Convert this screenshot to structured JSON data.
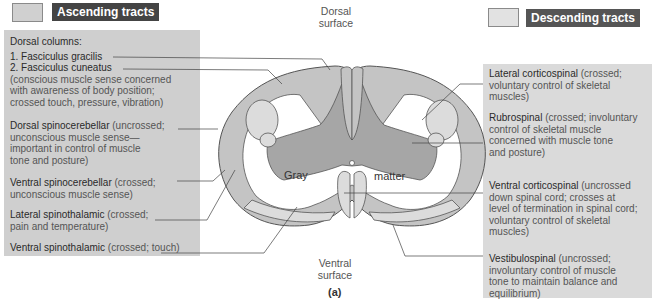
{
  "legend": {
    "ascending": {
      "label": "Ascending tracts",
      "swatch_color": "#d0d0d0"
    },
    "descending": {
      "label": "Descending tracts",
      "swatch_color": "#e2e2e2"
    }
  },
  "surfaces": {
    "dorsal": [
      "Dorsal",
      "surface"
    ],
    "ventral": [
      "Ventral",
      "surface"
    ]
  },
  "gray_matter": {
    "left": "Gray",
    "right": "matter"
  },
  "caption": "(a)",
  "ascending_tracts": {
    "dorsal_columns_header": "Dorsal columns:",
    "gracilis": "1. Fasciculus gracilis",
    "cuneatus": "2. Fasciculus cuneatus",
    "dorsal_columns_desc": [
      "(conscious muscle sense concerned",
      "with awareness of body position;",
      "crossed touch, pressure, vibration)"
    ],
    "dorsal_spinocerebellar": {
      "name": "Dorsal spinocerebellar",
      "desc_lines": [
        " (uncrossed;",
        "unconscious muscle sense—",
        "important in control of muscle",
        "tone and posture)"
      ]
    },
    "ventral_spinocerebellar": {
      "name": "Ventral spinocerebellar",
      "desc_lines": [
        " (crossed;",
        "unconscious muscle sense)"
      ]
    },
    "lateral_spinothalamic": {
      "name": "Lateral spinothalamic",
      "desc_lines": [
        " (crossed;",
        "pain and temperature)"
      ]
    },
    "ventral_spinothalamic": {
      "name": "Ventral spinothalamic",
      "desc_lines": [
        " (crossed; touch)"
      ]
    }
  },
  "descending_tracts": {
    "lateral_corticospinal": {
      "name": "Lateral corticospinal",
      "desc_lines": [
        " (crossed;",
        "voluntary control of skeletal",
        "muscles)"
      ]
    },
    "rubrospinal": {
      "name": "Rubrospinal",
      "desc_lines": [
        " (crossed; involuntary",
        "control of skeletal muscle",
        "concerned with muscle tone",
        "and posture)"
      ]
    },
    "ventral_corticospinal": {
      "name": "Ventral corticospinal",
      "desc_lines": [
        " (uncrossed",
        "down spinal cord; crosses at",
        "level of termination in spinal cord;",
        "voluntary control of skeletal",
        "muscles)"
      ]
    },
    "vestibulospinal": {
      "name": "Vestibulospinal",
      "desc_lines": [
        " (uncrossed;",
        "involuntary control of muscle",
        "tone to maintain balance and",
        "equilibrium)"
      ]
    }
  }
}
